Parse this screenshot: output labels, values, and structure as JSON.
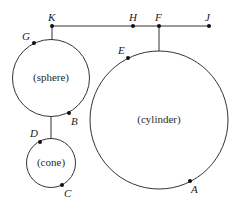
{
  "diagram": {
    "type": "mechanical-linkage",
    "colors": {
      "stroke": "#333333",
      "dot": "#111111",
      "background": "#ffffff"
    },
    "bar": {
      "y": 26,
      "x_start": 52,
      "x_end": 209
    },
    "points": {
      "K": {
        "label": "K",
        "x": 52,
        "y": 26
      },
      "H": {
        "label": "H",
        "x": 133,
        "y": 26
      },
      "F": {
        "label": "F",
        "x": 159,
        "y": 26
      },
      "J": {
        "label": "J",
        "x": 209,
        "y": 26
      },
      "G": {
        "label": "G",
        "x": 34,
        "y": 43
      },
      "B": {
        "label": "B",
        "x": 69,
        "y": 113
      },
      "D": {
        "label": "D",
        "x": 40,
        "y": 142
      },
      "C": {
        "label": "C",
        "x": 62,
        "y": 185
      },
      "E": {
        "label": "E",
        "x": 128,
        "y": 58
      },
      "A": {
        "label": "A",
        "x": 190,
        "y": 181
      }
    },
    "shapes": {
      "sphere": {
        "label": "(sphere)",
        "cx": 51,
        "cy": 78,
        "r": 38.5
      },
      "cone": {
        "label": "(cone)",
        "cx": 51,
        "cy": 163,
        "r": 24.5
      },
      "cylinder": {
        "label": "(cylinder)",
        "cx": 159,
        "cy": 120,
        "r": 69
      }
    }
  }
}
